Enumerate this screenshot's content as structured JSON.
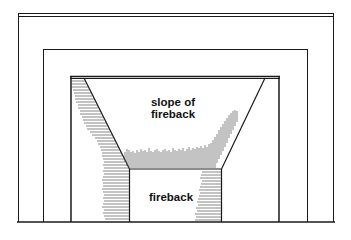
{
  "diagram": {
    "type": "fireplace-front-elevation",
    "labels": {
      "slope_line1": "slope of",
      "slope_line2": "fireback",
      "fireback": "fireback"
    },
    "colors": {
      "line": "#1a1a1a",
      "hatch": "#555555",
      "background": "#ffffff"
    }
  }
}
